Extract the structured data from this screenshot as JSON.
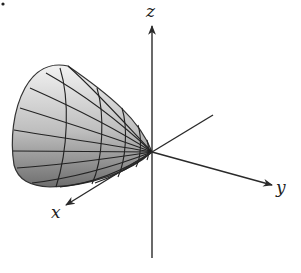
{
  "figure": {
    "type": "3d-surface-plot",
    "surface": "paraboloid opening toward negative y-axis, vertex at origin",
    "axes": {
      "x": {
        "label": "x"
      },
      "y": {
        "label": "y"
      },
      "z": {
        "label": "z"
      }
    },
    "colors": {
      "background": "#ffffff",
      "axis": "#2a2a2a",
      "surface_light": "#eeeeee",
      "surface_dark": "#777777",
      "mesh": "#222222"
    }
  }
}
